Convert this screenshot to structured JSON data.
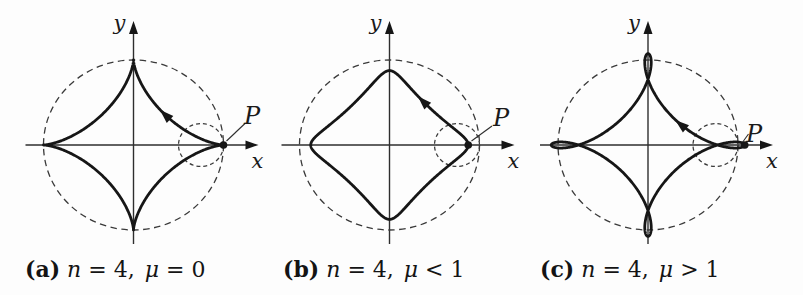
{
  "figure": {
    "panels": [
      {
        "caption": {
          "tag": "(a)",
          "var1": "n",
          "eq1": "= 4,",
          "var2": "μ",
          "eq2": "= 0"
        },
        "labels": {
          "x_axis": "x",
          "y_axis": "y",
          "point": "P"
        },
        "curve": {
          "kind": "astroid-with-4-cusps",
          "n": 4,
          "draw_mu": 1.0
        }
      },
      {
        "caption": {
          "tag": "(b)",
          "var1": "n",
          "eq1": "= 4,",
          "var2": "μ",
          "eq2": "< 1"
        },
        "labels": {
          "x_axis": "x",
          "y_axis": "y",
          "point": "P"
        },
        "curve": {
          "kind": "curtate-hypotrochoid-rounded-corners",
          "n": 4,
          "draw_mu": 0.5
        }
      },
      {
        "caption": {
          "tag": "(c)",
          "var1": "n",
          "eq1": "= 4,",
          "var2": "μ",
          "eq2": "> 1"
        },
        "labels": {
          "x_axis": "x",
          "y_axis": "y",
          "point": "P"
        },
        "curve": {
          "kind": "prolate-hypotrochoid-with-loops",
          "n": 4,
          "draw_mu": 1.3
        }
      }
    ],
    "colors": {
      "ink": "#161616",
      "line": "#2e2e2e",
      "dashed": "#3a3a3a",
      "background": "#fdfdfd"
    }
  }
}
